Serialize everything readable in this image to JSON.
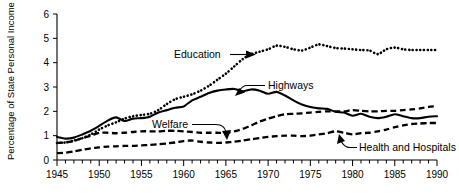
{
  "chart_data": {
    "type": "line",
    "title": "",
    "xlabel": "",
    "ylabel": "Percentage of State Personal Income",
    "xlim": [
      1945,
      1990
    ],
    "ylim": [
      0,
      6
    ],
    "ytick_labels": [
      "0",
      "1",
      "2",
      "3",
      "4",
      "5",
      "6"
    ],
    "ytick_values": [
      0,
      1,
      2,
      3,
      4,
      5,
      6
    ],
    "xtick_labels": [
      "1945",
      "1950",
      "1955",
      "1960",
      "1965",
      "1970",
      "1975",
      "1980",
      "1985",
      "1990"
    ],
    "xtick_values": [
      1945,
      1950,
      1955,
      1960,
      1965,
      1970,
      1975,
      1980,
      1985,
      1990
    ],
    "minor_xticks_every": 1,
    "grid": false,
    "legend": "inline-annotations",
    "x": [
      1945,
      1946,
      1947,
      1948,
      1949,
      1950,
      1951,
      1952,
      1953,
      1954,
      1955,
      1956,
      1957,
      1958,
      1959,
      1960,
      1961,
      1962,
      1963,
      1964,
      1965,
      1966,
      1967,
      1968,
      1969,
      1970,
      1971,
      1972,
      1973,
      1974,
      1975,
      1976,
      1977,
      1978,
      1979,
      1980,
      1981,
      1982,
      1983,
      1984,
      1985,
      1986,
      1987,
      1988,
      1989,
      1990
    ],
    "series": [
      {
        "name": "Education",
        "style": "dotted",
        "values": [
          0.7,
          0.72,
          0.8,
          0.9,
          1.05,
          1.25,
          1.42,
          1.55,
          1.7,
          1.8,
          1.85,
          1.9,
          2.05,
          2.3,
          2.5,
          2.6,
          2.7,
          2.85,
          3.05,
          3.3,
          3.55,
          3.85,
          4.15,
          4.35,
          4.45,
          4.55,
          4.7,
          4.65,
          4.55,
          4.5,
          4.62,
          4.75,
          4.68,
          4.6,
          4.58,
          4.55,
          4.52,
          4.5,
          4.35,
          4.55,
          4.62,
          4.55,
          4.52,
          4.52,
          4.52,
          4.52
        ]
      },
      {
        "name": "Highways",
        "style": "solid",
        "values": [
          0.95,
          0.88,
          0.92,
          1.05,
          1.2,
          1.4,
          1.62,
          1.75,
          1.6,
          1.7,
          1.72,
          1.78,
          1.95,
          2.05,
          2.15,
          2.2,
          2.45,
          2.6,
          2.75,
          2.85,
          2.9,
          2.92,
          2.82,
          2.9,
          2.85,
          2.72,
          2.8,
          2.65,
          2.45,
          2.28,
          2.18,
          2.12,
          2.1,
          1.98,
          1.95,
          1.82,
          1.9,
          1.78,
          1.72,
          1.78,
          1.88,
          1.8,
          1.72,
          1.72,
          1.78,
          1.8
        ]
      },
      {
        "name": "Welfare",
        "style": "dashed",
        "values": [
          0.7,
          0.72,
          0.78,
          0.9,
          1.0,
          1.12,
          1.12,
          1.1,
          1.12,
          1.15,
          1.18,
          1.18,
          1.18,
          1.2,
          1.2,
          1.18,
          1.15,
          1.12,
          1.12,
          1.12,
          1.12,
          1.18,
          1.28,
          1.42,
          1.58,
          1.7,
          1.8,
          1.88,
          1.9,
          1.92,
          1.95,
          1.98,
          2.0,
          2.0,
          2.0,
          2.05,
          2.02,
          2.0,
          2.0,
          2.02,
          2.02,
          2.05,
          2.08,
          2.12,
          2.18,
          2.22
        ]
      },
      {
        "name": "Health and Hospitals",
        "style": "dashed",
        "values": [
          0.28,
          0.3,
          0.35,
          0.42,
          0.48,
          0.52,
          0.55,
          0.56,
          0.58,
          0.58,
          0.6,
          0.62,
          0.65,
          0.68,
          0.72,
          0.78,
          0.8,
          0.75,
          0.72,
          0.7,
          0.72,
          0.75,
          0.8,
          0.85,
          0.9,
          0.95,
          0.98,
          1.0,
          1.0,
          0.98,
          1.0,
          1.05,
          1.1,
          1.18,
          1.12,
          1.05,
          1.1,
          1.12,
          1.18,
          1.25,
          1.35,
          1.42,
          1.48,
          1.5,
          1.52,
          1.52
        ]
      }
    ],
    "annotations": [
      {
        "name": "education",
        "label": "Education"
      },
      {
        "name": "highways",
        "label": "Highways"
      },
      {
        "name": "welfare",
        "label": "Welfare"
      },
      {
        "name": "health-and-hospitals",
        "label": "Health and Hospitals"
      }
    ],
    "colors": {
      "axis": "#000000",
      "series": "#000000",
      "background": "#ffffff"
    }
  }
}
